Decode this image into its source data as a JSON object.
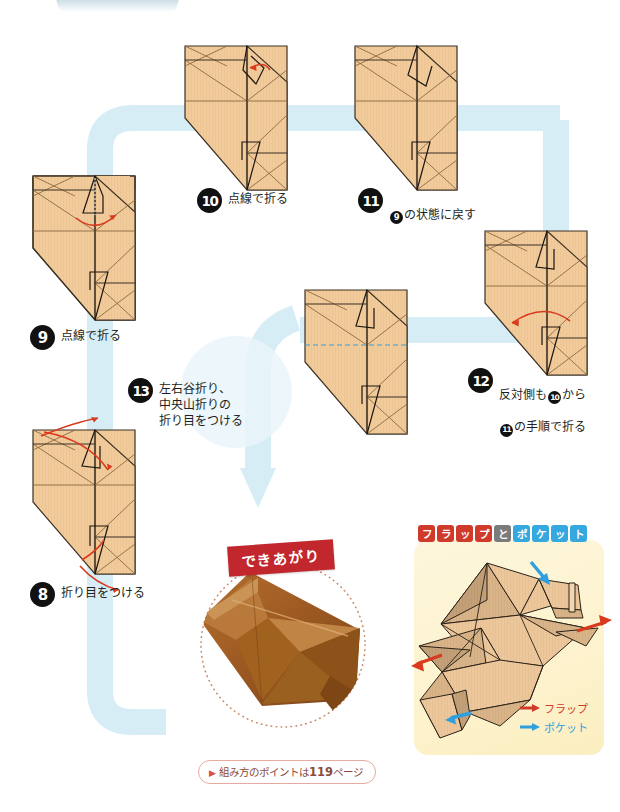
{
  "page": {
    "background_color": "#ffffff",
    "flow_path_color": "#d4ecf5",
    "paper_color": "#f0c89a",
    "paper_shade_color": "#d7b089",
    "fold_line_color": "#8a6a43",
    "edge_line_color": "#3b3124",
    "arrow_red": "#d93a1e",
    "arrow_blue": "#2f9fdd"
  },
  "top_tab": {
    "name": "page-tab",
    "color": "#9dc3d4"
  },
  "steps": [
    {
      "number": "8",
      "text": "折り目をつける"
    },
    {
      "number": "9",
      "text": "点線で折る"
    },
    {
      "number": "10",
      "text": "点線で折る"
    },
    {
      "number": "11",
      "text_before": "",
      "ref": "9",
      "text_after": "の状態に戻す"
    },
    {
      "number": "12",
      "line1_before": "反対側も",
      "line1_ref": "10",
      "line1_after": "から",
      "line2_ref": "11",
      "line2_after": "の手順で折る"
    },
    {
      "number": "13",
      "text": "左右谷折り、\n中央山折りの\n折り目をつける"
    }
  ],
  "finished": {
    "ribbon_label": "できあがり",
    "photo_alt": "完成した折り紙の写真",
    "photo_color": "#a8622a",
    "note_marker": "▶",
    "note_prefix": "組み方のポイントは",
    "note_page": "119",
    "note_suffix": "ページ"
  },
  "flap_pocket": {
    "title_chars": [
      {
        "char": "フ",
        "color": "red"
      },
      {
        "char": "ラ",
        "color": "red"
      },
      {
        "char": "ッ",
        "color": "red"
      },
      {
        "char": "プ",
        "color": "red"
      },
      {
        "char": "と",
        "color": "gray"
      },
      {
        "char": "ポ",
        "color": "blue"
      },
      {
        "char": "ケ",
        "color": "blue"
      },
      {
        "char": "ッ",
        "color": "blue"
      },
      {
        "char": "ト",
        "color": "blue"
      }
    ],
    "legend": [
      {
        "arrow": "red-arrow-icon",
        "label": "フラップ"
      },
      {
        "arrow": "blue-arrow-icon",
        "label": "ポケット"
      }
    ]
  }
}
